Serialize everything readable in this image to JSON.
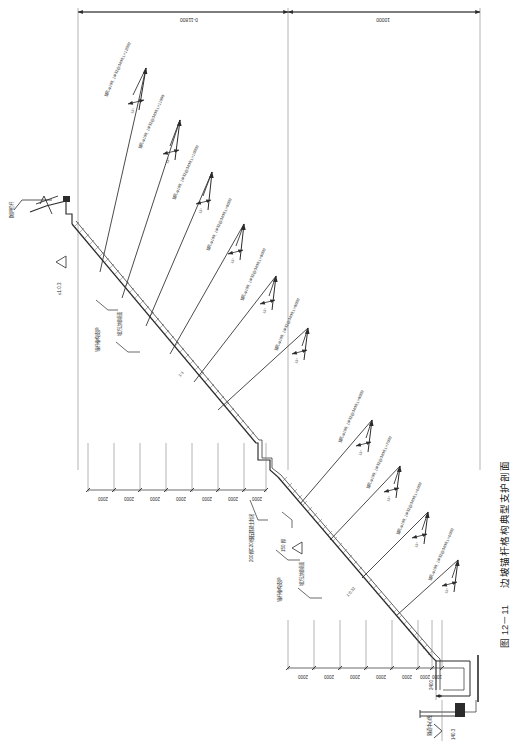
{
  "figure": {
    "number": "图 12－11",
    "caption": "边坡锚杆格构典型支护剖面",
    "caption_full": "图 12－11　边坡锚杆格构典型支护剖面",
    "orientation": "rotated-90",
    "drawing_type": "engineering-cross-section"
  },
  "top_dimensions": [
    {
      "label": "0-11800",
      "span": "left"
    },
    {
      "label": "10000",
      "span": "right"
    }
  ],
  "anchors": [
    {
      "id": 1,
      "label": "锚孔φ100, 1Φ32@3400,L=12000",
      "angle": "15°",
      "length": "12000",
      "hole": "φ100",
      "bar": "1Φ32@3400"
    },
    {
      "id": 2,
      "label": "锚孔φ100, 1Φ32@3400,L=11000",
      "angle": "15°",
      "length": "11000",
      "hole": "φ100",
      "bar": "1Φ32@3400"
    },
    {
      "id": 3,
      "label": "锚孔φ100, 1Φ32@3400,L=10000",
      "angle": "15°",
      "length": "10000",
      "hole": "φ100",
      "bar": "1Φ32@3400"
    },
    {
      "id": 4,
      "label": "锚孔φ100, 1Φ32@3400,L=9000",
      "angle": "15°",
      "length": "9000",
      "hole": "φ100",
      "bar": "1Φ32@3400"
    },
    {
      "id": 5,
      "label": "锚孔φ100, 1Φ32@3400,L=9000",
      "angle": "15°",
      "length": "9000",
      "hole": "φ100",
      "bar": "1Φ32@3400"
    },
    {
      "id": 6,
      "label": "锚孔φ100, 1Φ32@3400,L=8000",
      "angle": "15°",
      "length": "8000",
      "hole": "φ100",
      "bar": "1Φ32@3400"
    },
    {
      "id": 7,
      "label": "锚孔φ100, 1Φ32@3400,L=8000",
      "angle": "15°",
      "length": "8000",
      "hole": "φ100",
      "bar": "1Φ32@3400"
    },
    {
      "id": 8,
      "label": "锚孔φ100, 1Φ32@3400,L=7000",
      "angle": "15°",
      "length": "7000",
      "hole": "φ100",
      "bar": "1Φ32@3400"
    },
    {
      "id": 9,
      "label": "锚孔φ100, 1Φ32@3400,L=6000",
      "angle": "15°",
      "length": "6000",
      "hole": "φ100",
      "bar": "1Φ32@3400"
    },
    {
      "id": 10,
      "label": "锚孔φ100, 1Φ32@3400,L=6000",
      "angle": "15°",
      "length": "6000",
      "hole": "φ100",
      "bar": "1Φ32@3400"
    }
  ],
  "annotations": {
    "guardrail": "防护栏杆",
    "slope_top_ratio": "≤1:0.3",
    "lattice_support_upper": "锚杆格构支护",
    "lattice_support_lower": "锚杆格构支护",
    "shotcrete_upper": "坡方边坡喷面",
    "shotcrete_lower": "坡方边坡喷面",
    "concrete_seal": "200厚C20细石混凝土封闭",
    "thickness_150": "150 厚",
    "slope_ratio_mid": "1:1",
    "slope_ratio_lower": "1:0.32",
    "tunnel_centerline": "隧道中心线",
    "elevation": "140.3",
    "dim_2400": "2400"
  },
  "dimension_chain_upper": [
    "2000",
    "2000",
    "2000",
    "2000",
    "2000",
    "2000",
    "2000"
  ],
  "dimension_chain_lower": [
    "2000",
    "2000",
    "2000",
    "2000",
    "2000",
    "2000",
    "1000"
  ],
  "colors": {
    "line": "#2b2b2b",
    "thin_line": "#666666",
    "hatch": "#555555",
    "text": "#2b2b2b",
    "background": "#ffffff"
  }
}
